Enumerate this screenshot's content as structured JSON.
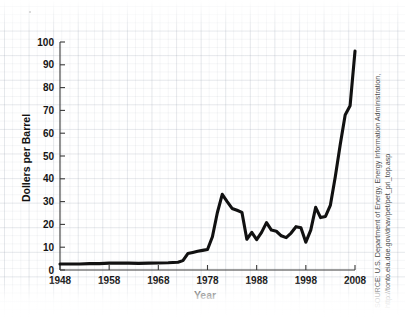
{
  "figure": {
    "background_color": "#ffffff",
    "line_color": "#111111",
    "axis_color": "#3a3a3a",
    "grid_color": "#96a0af"
  },
  "source": {
    "line1": "SOURCE: U.S. Department of Energy, Energy Information Administration,",
    "line2": "http://tonto.eia.doe.gov/dnav/pet/pet_pri_top.asp"
  },
  "chart_data": {
    "type": "line",
    "title": "",
    "xlabel": "Year",
    "ylabel": "Dollers per Barrel",
    "xlim": [
      1948,
      2008
    ],
    "ylim": [
      0,
      100
    ],
    "grid": true,
    "legend": "none",
    "xticks": [
      1948,
      1958,
      1968,
      1978,
      1988,
      1998,
      2008
    ],
    "yticks": [
      0,
      10,
      20,
      30,
      40,
      50,
      60,
      70,
      80,
      90,
      100
    ],
    "series": [
      {
        "name": "Crude Oil Price",
        "x": [
          1948,
          1950,
          1952,
          1954,
          1956,
          1958,
          1960,
          1962,
          1964,
          1966,
          1968,
          1970,
          1972,
          1973,
          1974,
          1975,
          1976,
          1977,
          1978,
          1979,
          1980,
          1981,
          1982,
          1983,
          1984,
          1985,
          1986,
          1987,
          1988,
          1989,
          1990,
          1991,
          1992,
          1993,
          1994,
          1995,
          1996,
          1997,
          1998,
          1999,
          2000,
          2001,
          2002,
          2003,
          2004,
          2005,
          2006,
          2007,
          2008
        ],
        "y": [
          2.6,
          2.6,
          2.6,
          2.8,
          2.8,
          3.0,
          3.0,
          3.0,
          2.9,
          3.0,
          3.1,
          3.2,
          3.4,
          4.1,
          7.2,
          7.7,
          8.2,
          8.6,
          9.0,
          14.6,
          25.1,
          33.2,
          30.0,
          27.0,
          26.2,
          25.3,
          13.5,
          16.5,
          13.3,
          16.5,
          20.8,
          17.5,
          17.0,
          15.0,
          14.2,
          16.2,
          19.0,
          18.5,
          12.2,
          17.5,
          27.5,
          23.0,
          23.5,
          28.5,
          41.0,
          55.0,
          68.0,
          72.0,
          96.0
        ]
      }
    ],
    "annotations": []
  }
}
